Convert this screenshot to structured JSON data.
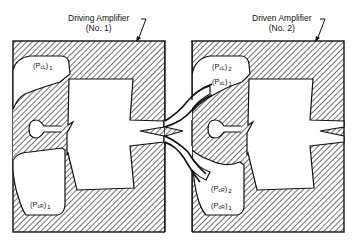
{
  "figure": {
    "type": "fluidic amplifier cascade schematic",
    "colors": {
      "line": "#111111",
      "hatch": "#222222",
      "background": "#ffffff"
    }
  },
  "amplifiers": [
    {
      "id": "driving",
      "label_line1": "Driving Amplifier",
      "label_line2": "(No. 1)",
      "ports": [
        {
          "name": "control-left",
          "symbol": "P",
          "sub": "cL",
          "index": "1",
          "text": "(PcL)1"
        },
        {
          "name": "control-right",
          "symbol": "P",
          "sub": "cR",
          "index": "1",
          "text": "(PcR)1"
        }
      ]
    },
    {
      "id": "driven",
      "label_line1": "Driven Amplifier",
      "label_line2": "(No. 2)",
      "ports": [
        {
          "name": "control-left",
          "symbol": "P",
          "sub": "cL",
          "index": "2",
          "text": "(PcL)2"
        },
        {
          "name": "output-left",
          "symbol": "P",
          "sub": "oL",
          "index": "1",
          "text": "(PoL)1"
        },
        {
          "name": "control-right",
          "symbol": "P",
          "sub": "cR",
          "index": "2",
          "text": "(PcR)2"
        },
        {
          "name": "output-right",
          "symbol": "P",
          "sub": "oR",
          "index": "1",
          "text": "(PoR)1"
        }
      ]
    }
  ]
}
